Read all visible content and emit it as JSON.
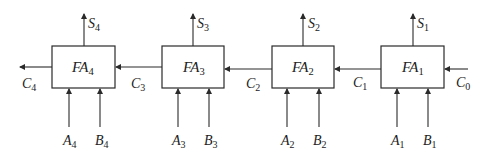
{
  "diagram": {
    "stroke_color": "#2a2a2a",
    "blocks": [
      {
        "id": "FA4",
        "label": "FA",
        "sub": "4",
        "sum": {
          "label": "S",
          "sub": "4"
        },
        "a": {
          "label": "A",
          "sub": "4"
        },
        "b": {
          "label": "B",
          "sub": "4"
        }
      },
      {
        "id": "FA3",
        "label": "FA",
        "sub": "3",
        "sum": {
          "label": "S",
          "sub": "3"
        },
        "a": {
          "label": "A",
          "sub": "3"
        },
        "b": {
          "label": "B",
          "sub": "3"
        }
      },
      {
        "id": "FA2",
        "label": "FA",
        "sub": "2",
        "sum": {
          "label": "S",
          "sub": "2"
        },
        "a": {
          "label": "A",
          "sub": "2"
        },
        "b": {
          "label": "B",
          "sub": "2"
        }
      },
      {
        "id": "FA1",
        "label": "FA",
        "sub": "1",
        "sum": {
          "label": "S",
          "sub": "1"
        },
        "a": {
          "label": "A",
          "sub": "1"
        },
        "b": {
          "label": "B",
          "sub": "1"
        }
      }
    ],
    "carries": [
      {
        "label": "C",
        "sub": "4"
      },
      {
        "label": "C",
        "sub": "3"
      },
      {
        "label": "C",
        "sub": "2"
      },
      {
        "label": "C",
        "sub": "1"
      },
      {
        "label": "C",
        "sub": "0"
      }
    ]
  }
}
